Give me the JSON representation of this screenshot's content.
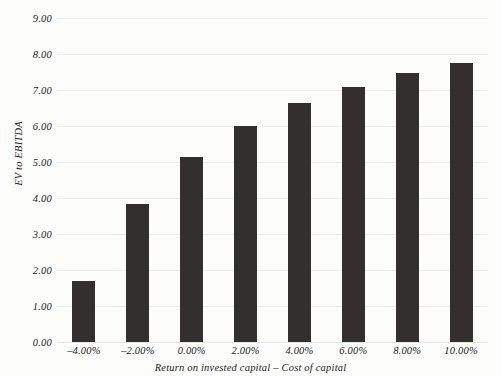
{
  "chart_data": {
    "type": "bar",
    "title": "",
    "xlabel": "Return on invested capital – Cost of capital",
    "ylabel": "EV to EBITDA",
    "categories": [
      "-4.00%",
      "-2.00%",
      "0.00%",
      "2.00%",
      "4.00%",
      "6.00%",
      "8.00%",
      "10.00%"
    ],
    "values": [
      1.7,
      3.83,
      5.14,
      6.0,
      6.64,
      7.08,
      7.47,
      7.75
    ],
    "ylim": [
      0.0,
      9.0
    ],
    "y_ticks": [
      "0.00",
      "1.00",
      "2.00",
      "3.00",
      "4.00",
      "5.00",
      "6.00",
      "7.00",
      "8.00",
      "9.00"
    ],
    "y_tick_values": [
      0,
      1,
      2,
      3,
      4,
      5,
      6,
      7,
      8,
      9
    ],
    "grid": true,
    "legend": "none",
    "bar_color": "#332f2f",
    "grid_color": "#ececeb",
    "background_color": "#fdfdfc",
    "text_color": "#1c1c1c"
  }
}
